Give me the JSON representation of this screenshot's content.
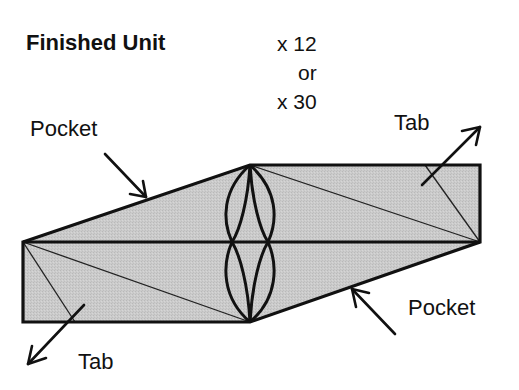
{
  "title": "Finished Unit",
  "count": {
    "line1": "x 12",
    "line2": "or",
    "line3": "x 30"
  },
  "labels": {
    "pocket_top": "Pocket",
    "tab_top": "Tab",
    "pocket_bottom": "Pocket",
    "tab_bottom": "Tab"
  },
  "colors": {
    "fill": "#c8c8c8",
    "stroke": "#111111",
    "background": "#ffffff"
  },
  "icons": {
    "pocket_top_arrow": "arrow-down-right-icon",
    "tab_top_arrow": "arrow-up-right-icon",
    "pocket_bottom_arrow": "arrow-up-left-icon",
    "tab_bottom_arrow": "arrow-down-left-icon"
  }
}
